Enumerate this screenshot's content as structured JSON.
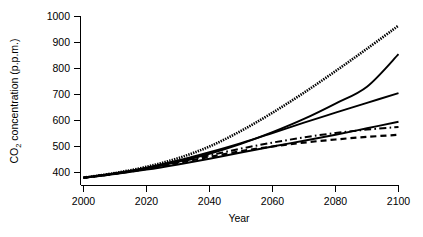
{
  "chart_data": {
    "type": "line",
    "title": "",
    "xlabel": "Year",
    "ylabel": "CO2 concentration (p.p.m.)",
    "ylabel_main": "CO",
    "ylabel_sub": "2",
    "ylabel_rest": " concentration (p.p.m.)",
    "xlim": [
      2000,
      2100
    ],
    "ylim": [
      350,
      1010
    ],
    "grid": false,
    "legend": "none",
    "xticks": [
      2000,
      2020,
      2040,
      2060,
      2080,
      2100
    ],
    "xtick_labels": [
      "2000",
      "2020",
      "2040",
      "2060",
      "2080",
      "2100"
    ],
    "yticks": [
      400,
      500,
      600,
      700,
      800,
      900,
      1000
    ],
    "ytick_labels": [
      "400",
      "500",
      "600",
      "700",
      "800",
      "900",
      "1000"
    ],
    "x": [
      2000,
      2010,
      2020,
      2030,
      2040,
      2050,
      2060,
      2070,
      2080,
      2090,
      2100
    ],
    "series": [
      {
        "name": "A1FI",
        "style": "dotted",
        "color": "#000000",
        "values": [
          380,
          398,
          422,
          455,
          500,
          560,
          630,
          707,
          790,
          876,
          965
        ]
      },
      {
        "name": "A2",
        "style": "solid",
        "color": "#000000",
        "values": [
          380,
          396,
          416,
          441,
          472,
          510,
          555,
          606,
          665,
          730,
          855
        ]
      },
      {
        "name": "A1B",
        "style": "solid",
        "color": "#000000",
        "values": [
          380,
          397,
          419,
          446,
          478,
          513,
          552,
          592,
          630,
          668,
          705
        ]
      },
      {
        "name": "B2",
        "style": "solid",
        "color": "#000000",
        "values": [
          380,
          394,
          411,
          431,
          453,
          477,
          500,
          522,
          545,
          570,
          595
        ]
      },
      {
        "name": "A1T",
        "style": "dashdot",
        "color": "#000000",
        "values": [
          380,
          396,
          416,
          440,
          466,
          492,
          515,
          535,
          552,
          565,
          575
        ]
      },
      {
        "name": "B1",
        "style": "dashed",
        "color": "#000000",
        "values": [
          380,
          395,
          414,
          437,
          460,
          482,
          500,
          515,
          527,
          537,
          545
        ]
      }
    ]
  },
  "axes": {
    "x_title": "Year",
    "y_title_prefix": "CO",
    "y_title_subscript": "2",
    "y_title_suffix": " concentration (p.p.m.)"
  }
}
